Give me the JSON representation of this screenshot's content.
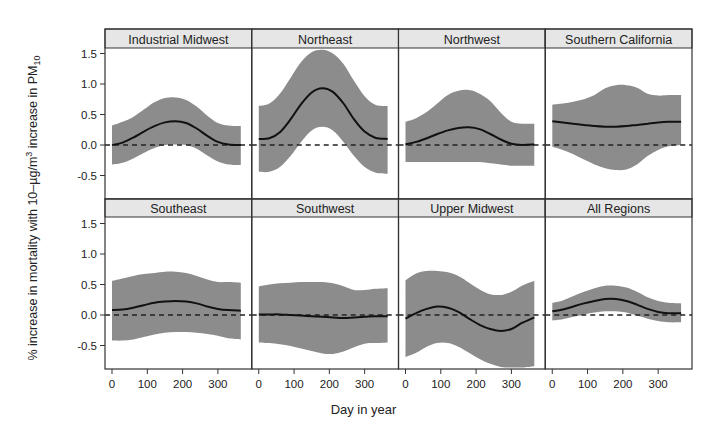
{
  "chart_data": {
    "type": "area",
    "title": "",
    "xlabel": "Day in year",
    "ylabel": "% increase in mortality with 10-µg/m³ increase in PM10",
    "ylabel_parts": {
      "main": "% increase in mortality with 10–µg/m",
      "sup": "3",
      "mid": " increase in PM",
      "sub": "10"
    },
    "xlim": [
      0,
      365
    ],
    "ylim": [
      -0.85,
      1.6
    ],
    "xticks": [
      0,
      100,
      200,
      300
    ],
    "xtick_labels": [
      "0",
      "100",
      "200",
      "300"
    ],
    "yticks": [
      -0.5,
      0.0,
      0.5,
      1.0,
      1.5
    ],
    "ytick_labels": [
      "-0.5",
      "0.0",
      "0.5",
      "1.0",
      "1.5"
    ],
    "reference_line": {
      "y": 0.0,
      "style": "dashed"
    },
    "grid": false,
    "layout": {
      "rows": 2,
      "cols": 4
    },
    "colors": {
      "band": "#8c8c8c",
      "line": "#111111",
      "strip": "#e6e6e6",
      "frame": "#333333"
    },
    "x": [
      0,
      30,
      60,
      90,
      120,
      150,
      180,
      210,
      240,
      270,
      300,
      330,
      365
    ],
    "panels": [
      {
        "name": "Industrial Midwest",
        "estimate": [
          0.0,
          0.04,
          0.12,
          0.22,
          0.31,
          0.37,
          0.39,
          0.36,
          0.27,
          0.15,
          0.05,
          0.01,
          0.0
        ],
        "upper": [
          0.32,
          0.38,
          0.46,
          0.58,
          0.7,
          0.77,
          0.78,
          0.74,
          0.63,
          0.48,
          0.36,
          0.32,
          0.31
        ],
        "lower": [
          -0.32,
          -0.29,
          -0.22,
          -0.13,
          -0.05,
          0.0,
          0.01,
          0.0,
          -0.06,
          -0.17,
          -0.27,
          -0.32,
          -0.33
        ]
      },
      {
        "name": "Northeast",
        "estimate": [
          0.1,
          0.11,
          0.21,
          0.42,
          0.67,
          0.86,
          0.93,
          0.87,
          0.68,
          0.42,
          0.22,
          0.12,
          0.1
        ],
        "upper": [
          0.64,
          0.68,
          0.84,
          1.1,
          1.36,
          1.52,
          1.56,
          1.5,
          1.33,
          1.05,
          0.8,
          0.66,
          0.64
        ],
        "lower": [
          -0.44,
          -0.44,
          -0.36,
          -0.18,
          0.05,
          0.24,
          0.3,
          0.24,
          0.05,
          -0.18,
          -0.36,
          -0.45,
          -0.47
        ]
      },
      {
        "name": "Northwest",
        "estimate": [
          0.01,
          0.05,
          0.11,
          0.18,
          0.24,
          0.28,
          0.29,
          0.26,
          0.18,
          0.09,
          0.02,
          0.0,
          0.01
        ],
        "upper": [
          0.38,
          0.44,
          0.54,
          0.68,
          0.82,
          0.89,
          0.9,
          0.84,
          0.72,
          0.53,
          0.38,
          0.35,
          0.35
        ],
        "lower": [
          -0.28,
          -0.28,
          -0.28,
          -0.28,
          -0.28,
          -0.28,
          -0.28,
          -0.28,
          -0.3,
          -0.32,
          -0.34,
          -0.34,
          -0.34
        ]
      },
      {
        "name": "Southern California",
        "estimate": [
          0.39,
          0.37,
          0.35,
          0.33,
          0.31,
          0.3,
          0.3,
          0.31,
          0.33,
          0.35,
          0.37,
          0.38,
          0.38
        ],
        "upper": [
          0.66,
          0.68,
          0.71,
          0.75,
          0.82,
          0.93,
          0.98,
          0.98,
          0.94,
          0.84,
          0.81,
          0.82,
          0.82
        ],
        "lower": [
          -0.03,
          -0.08,
          -0.15,
          -0.24,
          -0.32,
          -0.38,
          -0.41,
          -0.4,
          -0.32,
          -0.18,
          -0.08,
          -0.02,
          0.0
        ]
      },
      {
        "name": "Southeast",
        "estimate": [
          0.08,
          0.09,
          0.12,
          0.16,
          0.2,
          0.22,
          0.23,
          0.22,
          0.19,
          0.14,
          0.1,
          0.08,
          0.07
        ],
        "upper": [
          0.56,
          0.6,
          0.64,
          0.67,
          0.69,
          0.71,
          0.71,
          0.69,
          0.64,
          0.58,
          0.54,
          0.54,
          0.53
        ],
        "lower": [
          -0.42,
          -0.42,
          -0.4,
          -0.36,
          -0.32,
          -0.29,
          -0.28,
          -0.28,
          -0.29,
          -0.31,
          -0.34,
          -0.38,
          -0.4
        ]
      },
      {
        "name": "Southwest",
        "estimate": [
          0.01,
          0.01,
          0.01,
          0.0,
          -0.01,
          -0.02,
          -0.03,
          -0.04,
          -0.05,
          -0.04,
          -0.03,
          -0.02,
          -0.02
        ],
        "upper": [
          0.47,
          0.5,
          0.52,
          0.53,
          0.54,
          0.54,
          0.54,
          0.52,
          0.47,
          0.41,
          0.41,
          0.43,
          0.44
        ],
        "lower": [
          -0.45,
          -0.46,
          -0.48,
          -0.51,
          -0.55,
          -0.59,
          -0.63,
          -0.64,
          -0.6,
          -0.53,
          -0.47,
          -0.46,
          -0.45
        ]
      },
      {
        "name": "Upper Midwest",
        "estimate": [
          -0.06,
          0.03,
          0.1,
          0.14,
          0.12,
          0.05,
          -0.06,
          -0.16,
          -0.23,
          -0.26,
          -0.23,
          -0.13,
          -0.04
        ],
        "upper": [
          0.57,
          0.68,
          0.72,
          0.72,
          0.7,
          0.64,
          0.53,
          0.42,
          0.34,
          0.33,
          0.38,
          0.48,
          0.56
        ],
        "lower": [
          -0.69,
          -0.62,
          -0.52,
          -0.46,
          -0.46,
          -0.52,
          -0.62,
          -0.72,
          -0.8,
          -0.85,
          -0.86,
          -0.86,
          -0.84
        ]
      },
      {
        "name": "All Regions",
        "estimate": [
          0.06,
          0.09,
          0.14,
          0.19,
          0.23,
          0.26,
          0.26,
          0.23,
          0.17,
          0.1,
          0.05,
          0.03,
          0.03
        ],
        "upper": [
          0.2,
          0.24,
          0.31,
          0.38,
          0.44,
          0.48,
          0.48,
          0.45,
          0.38,
          0.29,
          0.23,
          0.2,
          0.19
        ],
        "lower": [
          -0.09,
          -0.07,
          -0.03,
          0.01,
          0.04,
          0.06,
          0.06,
          0.04,
          -0.01,
          -0.06,
          -0.1,
          -0.12,
          -0.12
        ]
      }
    ]
  }
}
